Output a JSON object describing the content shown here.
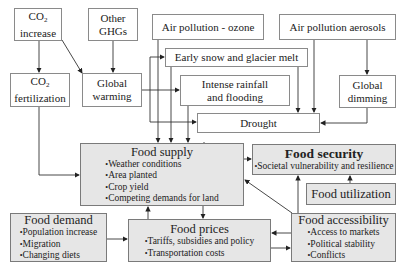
{
  "diagram": {
    "nodes": {
      "co2_increase": {
        "line1": "CO",
        "sub": "2",
        "line2": "increase"
      },
      "other_ghgs": {
        "line1": "Other",
        "line2": "GHGs"
      },
      "co2_fertilization": {
        "line1": "CO",
        "sub": "2",
        "line2": "fertilization"
      },
      "global_warming": {
        "line1": "Global",
        "line2": "warming"
      },
      "air_pollution_ozone": {
        "label": "Air pollution - ozone"
      },
      "air_pollution_aerosols": {
        "label": "Air pollution aerosols"
      },
      "early_snow": {
        "label": "Early snow and glacier melt"
      },
      "intense_rainfall": {
        "line1": "Intense rainfall",
        "line2": "and flooding"
      },
      "global_dimming": {
        "line1": "Global",
        "line2": "dimming"
      },
      "drought": {
        "label": "Drought"
      },
      "food_supply": {
        "title": "Food supply",
        "bullets": [
          "Weather conditions",
          "Area planted",
          "Crop yield",
          "Competing demands for land"
        ]
      },
      "food_security": {
        "title": "Food security",
        "bullets": [
          "Societal vulnerability and resilience"
        ]
      },
      "food_utilization": {
        "label": "Food utilization"
      },
      "food_demand": {
        "title": "Food demand",
        "bullets": [
          "Population increase",
          "Migration",
          "Changing diets"
        ]
      },
      "food_prices": {
        "title": "Food prices",
        "bullets": [
          "Tariffs, subsidies and policy",
          "Transportation costs"
        ]
      },
      "food_accessibility": {
        "title": "Food accessibility",
        "bullets": [
          "Access to markets",
          "Political stability",
          "Conflicts"
        ]
      }
    },
    "colors": {
      "shaded_fill": "#e6e6e6",
      "border": "#8a8a8a",
      "line": "#333333"
    }
  }
}
